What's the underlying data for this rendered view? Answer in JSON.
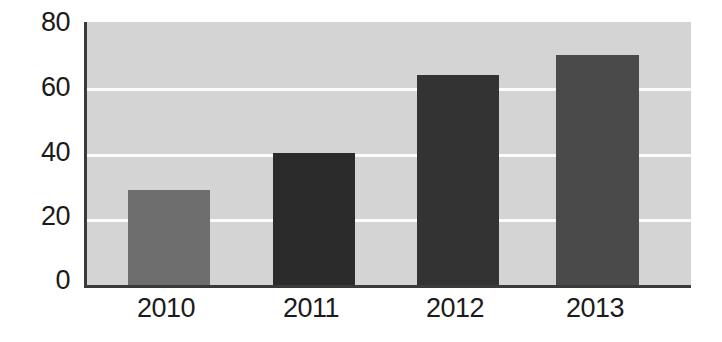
{
  "chart_data": {
    "type": "bar",
    "title": "",
    "subtitle": "",
    "xlabel": "",
    "ylabel": "",
    "categories": [
      "2010",
      "2011",
      "2012",
      "2013"
    ],
    "values": [
      29,
      40,
      64,
      70
    ],
    "series": [
      {
        "name": "",
        "values": [
          29,
          40,
          64,
          70
        ]
      }
    ],
    "ylim": [
      0,
      80
    ],
    "yticks": [
      0,
      20,
      40,
      60,
      80
    ],
    "ytick_labels": [
      "0",
      "20",
      "40",
      "60",
      "80"
    ],
    "xtick_labels": [
      "2010",
      "2011",
      "2012",
      "2013"
    ],
    "grid": true,
    "grid_axis": "y",
    "legend": false,
    "legend_position": "none",
    "annotations": [],
    "bar_colors": [
      "#6e6e6e",
      "#2b2b2b",
      "#333333",
      "#4a4a4a"
    ],
    "plot_background": "#d4d4d4",
    "gridline_color": "#fbfbfb",
    "axis_color": "#3a3a3a",
    "figure_background": "#ffffff",
    "text_color": "#1b1b1b"
  }
}
